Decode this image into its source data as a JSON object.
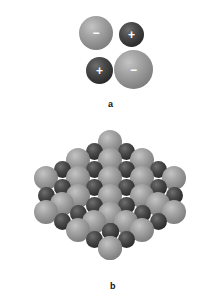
{
  "figure": {
    "colors": {
      "background": "#ffffff",
      "anion": "#9a9a9a",
      "cation": "#3a3a3a",
      "sign": "#ffffff"
    },
    "panel_a": {
      "label": "a",
      "label_pos": [
        108,
        99
      ],
      "ions": [
        {
          "type": "anion",
          "sign": "−",
          "x": 79,
          "y": 16,
          "d": 34
        },
        {
          "type": "cation",
          "sign": "+",
          "x": 119,
          "y": 22,
          "d": 25
        },
        {
          "type": "cation",
          "sign": "+",
          "x": 86,
          "y": 57,
          "d": 27
        },
        {
          "type": "anion",
          "sign": "−",
          "x": 114,
          "y": 50,
          "d": 39
        }
      ]
    },
    "panel_b": {
      "label": "b",
      "label_pos": [
        110,
        281
      ],
      "description": "ionic crystal lattice block of alternating large anions and small cations"
    }
  }
}
